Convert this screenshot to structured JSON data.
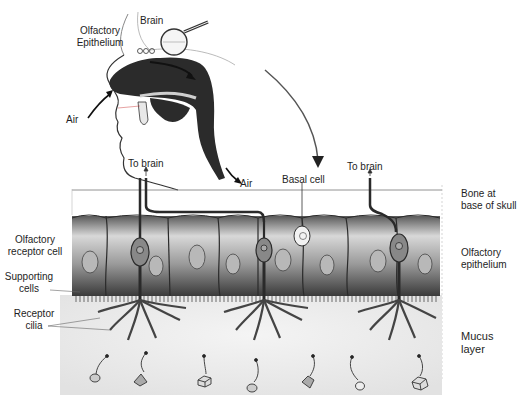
{
  "diagram": {
    "head_view": {
      "labels": {
        "brain": "Brain",
        "olfactory_epithelium": "Olfactory\nEpithelium",
        "olfactory_epithelium_line1": "Olfactory",
        "olfactory_epithelium_line2": "Epithelium",
        "air_in": "Air",
        "air_out": "Air"
      },
      "magnifier": "magnifying-glass-icon"
    },
    "section_view": {
      "top_labels": {
        "to_brain_left": "To brain",
        "basal_cell": "Basal cell",
        "to_brain_right": "To brain"
      },
      "left_labels": {
        "olfactory_receptor_cell_line1": "Olfactory",
        "olfactory_receptor_cell_line2": "receptor cell",
        "supporting_cells_line1": "Supporting",
        "supporting_cells_line2": "cells",
        "receptor_cilia_line1": "Receptor",
        "receptor_cilia_line2": "cilia"
      },
      "right_labels": {
        "bone_line1": "Bone at",
        "bone_line2": "base of skull",
        "epithelium_line1": "Olfactory",
        "epithelium_line2": "epithelium",
        "mucus_line1": "Mucus",
        "mucus_line2": "layer"
      }
    },
    "odorant_molecules": [
      {
        "shape": "sphere"
      },
      {
        "shape": "pyramid"
      },
      {
        "shape": "cube"
      },
      {
        "shape": "sphere"
      },
      {
        "shape": "pyramid"
      },
      {
        "shape": "sphere"
      },
      {
        "shape": "cube"
      }
    ],
    "colors": {
      "ink": "#1e1e24",
      "cavity": "#2b2b2b",
      "cell_dark": "#4a4a4a",
      "cell_light": "#d9d9d9",
      "mucus": "#eeeeee"
    }
  }
}
